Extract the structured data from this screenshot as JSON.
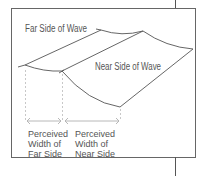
{
  "diagram": {
    "labels": {
      "far_side": "Far Side of Wave",
      "near_side": "Near Side of Wave"
    },
    "measure_labels": {
      "far": [
        "Perceived",
        "Width of",
        "Far Side"
      ],
      "near": [
        "Perceived",
        "Width of",
        "Near Side"
      ]
    },
    "colors": {
      "line": "#444444",
      "frame": "#555555",
      "dashed": "#c8c8c8",
      "arrow": "#b0b0b0",
      "text": "#555555"
    }
  }
}
